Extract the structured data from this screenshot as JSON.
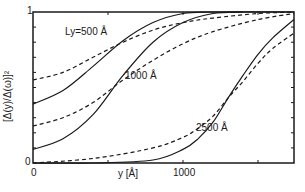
{
  "chart_data": {
    "type": "line",
    "title": "",
    "xlabel": "y [Å]",
    "ylabel": "[Δ(y)/Δ(ω)]²",
    "xlim": [
      0,
      1740
    ],
    "ylim": [
      0,
      1
    ],
    "x_ticks": [
      "0",
      "1000"
    ],
    "y_ticks": [
      "0",
      "1"
    ],
    "grid": false,
    "legend": "inline curve annotations",
    "annotations": [
      "Ly=500 Å",
      "1000 Å",
      "2500 Å"
    ],
    "line_styles": {
      "solid": "curve A",
      "dashed": "curve B"
    },
    "series": [
      {
        "name": "Ly=500 Å (solid)",
        "style": "solid",
        "x": [
          0,
          200,
          400,
          600,
          800,
          1000,
          1200,
          1740
        ],
        "y": [
          0.39,
          0.48,
          0.64,
          0.81,
          0.93,
          0.99,
          1.0,
          1.0
        ]
      },
      {
        "name": "Ly=500 Å (dashed)",
        "style": "dashed",
        "x": [
          0,
          200,
          400,
          600,
          800,
          1000,
          1200,
          1500,
          1740
        ],
        "y": [
          0.55,
          0.6,
          0.7,
          0.8,
          0.88,
          0.93,
          0.96,
          0.99,
          1.0
        ]
      },
      {
        "name": "1000 Å (solid)",
        "style": "solid",
        "x": [
          0,
          200,
          400,
          600,
          800,
          1000,
          1200,
          1400
        ],
        "y": [
          0.09,
          0.16,
          0.32,
          0.58,
          0.8,
          0.93,
          0.99,
          1.0
        ]
      },
      {
        "name": "1000 Å (dashed)",
        "style": "dashed",
        "x": [
          0,
          200,
          400,
          600,
          800,
          1000,
          1200,
          1500,
          1740
        ],
        "y": [
          0.245,
          0.3,
          0.4,
          0.55,
          0.68,
          0.79,
          0.87,
          0.95,
          0.99
        ]
      },
      {
        "name": "2500 Å (solid)",
        "style": "solid",
        "x": [
          0,
          400,
          800,
          1000,
          1100,
          1200,
          1300,
          1400,
          1500,
          1600,
          1740
        ],
        "y": [
          0.0,
          0.0,
          0.02,
          0.09,
          0.16,
          0.27,
          0.43,
          0.58,
          0.72,
          0.83,
          0.95
        ]
      },
      {
        "name": "2500 Å (dashed)",
        "style": "dashed",
        "x": [
          0,
          400,
          800,
          1000,
          1100,
          1200,
          1300,
          1400,
          1500,
          1600,
          1740
        ],
        "y": [
          0.0,
          0.03,
          0.1,
          0.17,
          0.23,
          0.31,
          0.43,
          0.54,
          0.66,
          0.76,
          0.86
        ]
      }
    ]
  },
  "labels": {
    "ylabel": "[Δ(y)/Δ(ω)]²",
    "xlabel": "y [Å]",
    "x_tick_0": "0",
    "x_tick_1000": "1000",
    "y_tick_0": "0",
    "y_tick_1": "1",
    "ann_500": "Ly=500 Å",
    "ann_1000": "1000 Å",
    "ann_2500": "2500 Å"
  }
}
